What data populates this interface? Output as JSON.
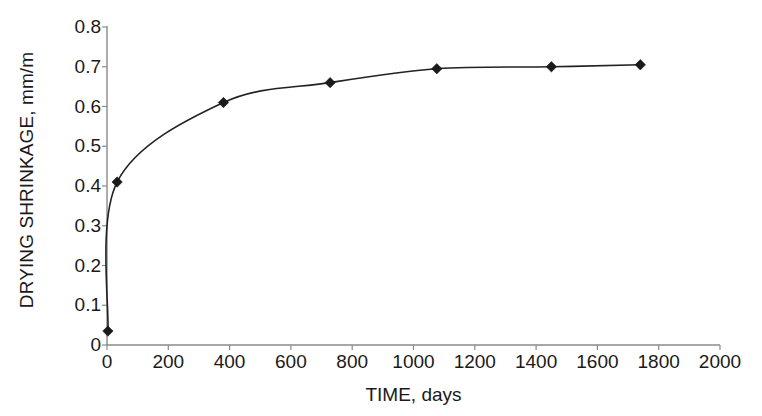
{
  "chart_data": {
    "type": "line",
    "title": "",
    "xlabel": "TIME, days",
    "ylabel": "DRYING SHRINKAGE, mm/m",
    "xlim": [
      0,
      2000
    ],
    "ylim": [
      0,
      0.8
    ],
    "xticks": [
      0,
      200,
      400,
      600,
      800,
      1000,
      1200,
      1400,
      1600,
      1800,
      2000
    ],
    "xtick_labels": [
      "0",
      "200",
      "400",
      "600",
      "800",
      "1000",
      "1200",
      "1400",
      "1600",
      "1800",
      "2000"
    ],
    "yticks": [
      0,
      0.1,
      0.2,
      0.3,
      0.4,
      0.5,
      0.6,
      0.7,
      0.8
    ],
    "ytick_labels": [
      "0",
      "0.1",
      "0.2",
      "0.3",
      "0.4",
      "0.5",
      "0.6",
      "0.7",
      "0.8"
    ],
    "grid": false,
    "legend": false,
    "marker": "diamond",
    "line_color": "#222222",
    "marker_color": "#1a1a1a",
    "series": [
      {
        "name": "Drying shrinkage",
        "x": [
          3,
          33,
          380,
          728,
          1076,
          1450,
          1740
        ],
        "values": [
          0.035,
          0.41,
          0.61,
          0.66,
          0.695,
          0.7,
          0.705
        ]
      }
    ]
  },
  "axes": {
    "y_title": "DRYING SHRINKAGE, mm/m",
    "x_title": "TIME, days"
  }
}
